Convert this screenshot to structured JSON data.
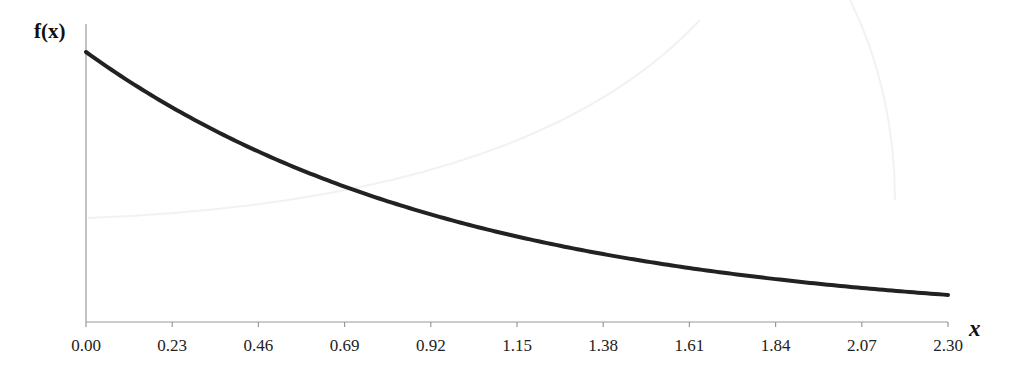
{
  "chart_data": {
    "type": "line",
    "title": "",
    "xlabel": "x",
    "ylabel": "f(x)",
    "function": "f(x) = e^(-x)",
    "x_ticks": [
      "0.00",
      "0.23",
      "0.46",
      "0.69",
      "0.92",
      "1.15",
      "1.38",
      "1.61",
      "1.84",
      "2.07",
      "2.30"
    ],
    "xlim": [
      0,
      2.3
    ],
    "ylim": [
      0,
      1
    ],
    "y_ticks": [],
    "grid": false,
    "legend": null,
    "series": [
      {
        "name": "f(x)",
        "x": [
          0.0,
          0.23,
          0.46,
          0.69,
          0.92,
          1.15,
          1.38,
          1.61,
          1.84,
          2.07,
          2.3
        ],
        "values": [
          1.0,
          0.795,
          0.631,
          0.502,
          0.399,
          0.317,
          0.252,
          0.2,
          0.159,
          0.126,
          0.1
        ],
        "color": "#222222"
      }
    ]
  },
  "colors": {
    "curve": "#222222",
    "axis": "#999999",
    "text": "#222222"
  }
}
